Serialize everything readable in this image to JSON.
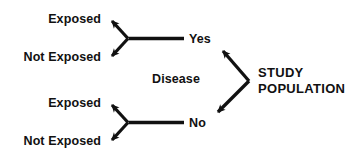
{
  "diagram": {
    "type": "cohort-study-design-flow",
    "title_text": "",
    "colors": {
      "stroke": "#111111",
      "text": "#111111",
      "background": "#ffffff"
    },
    "population": {
      "line1": "STUDY",
      "line2": "POPULATION"
    },
    "disease_label": "Disease",
    "branches": [
      {
        "id": "disease-yes",
        "value": "Yes",
        "outcomes": [
          {
            "id": "yes-exposed",
            "label": "Exposed"
          },
          {
            "id": "yes-not-exposed",
            "label": "Not Exposed"
          }
        ]
      },
      {
        "id": "disease-no",
        "value": "No",
        "outcomes": [
          {
            "id": "no-exposed",
            "label": "Exposed"
          },
          {
            "id": "no-not-exposed",
            "label": "Not Exposed"
          }
        ]
      }
    ],
    "arrows": [
      {
        "id": "population-to-yes",
        "direction": "up-left"
      },
      {
        "id": "population-to-no",
        "direction": "down-left"
      },
      {
        "id": "yes-to-exposed",
        "direction": "up-left"
      },
      {
        "id": "yes-to-not-exposed",
        "direction": "down-left"
      },
      {
        "id": "no-to-exposed",
        "direction": "up-left"
      },
      {
        "id": "no-to-not-exposed",
        "direction": "down-left"
      }
    ]
  }
}
